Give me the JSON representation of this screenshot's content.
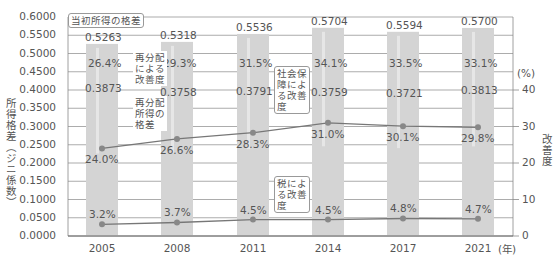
{
  "chart_data": [
    {
      "type": "bar",
      "title": "",
      "xlabel": "(年)",
      "ylabel": "所得格差（ジニ係数）",
      "categories": [
        "2005",
        "2008",
        "2011",
        "2014",
        "2017",
        "2021"
      ],
      "series": [
        {
          "name": "当初所得の格差",
          "values": [
            0.5263,
            0.5318,
            0.5536,
            0.5704,
            0.5594,
            0.57
          ]
        },
        {
          "name": "再分配所得の格差",
          "values": [
            0.3873,
            0.3758,
            0.3791,
            0.3759,
            0.3721,
            0.3813
          ]
        }
      ],
      "ylim": [
        0,
        0.6
      ],
      "ytick_step": 0.05,
      "grid": true
    },
    {
      "type": "line",
      "ylabel": "改善度",
      "yunit": "(%)",
      "categories": [
        "2005",
        "2008",
        "2011",
        "2014",
        "2017",
        "2021"
      ],
      "series": [
        {
          "name": "再分配による改善度",
          "values": [
            26.4,
            29.3,
            31.5,
            34.1,
            33.5,
            33.1
          ],
          "display": "label-in-bar"
        },
        {
          "name": "社会保障による改善度",
          "values": [
            24.0,
            26.6,
            28.3,
            31.0,
            30.1,
            29.8
          ]
        },
        {
          "name": "税による改善度",
          "values": [
            3.2,
            3.7,
            4.5,
            4.5,
            4.8,
            4.7
          ]
        }
      ],
      "ylim": [
        0,
        40
      ],
      "ytick_step": 10
    }
  ],
  "axes": {
    "left_title": "所得格差（ジニ係数）",
    "left_ticks": [
      "0.6000",
      "0.5500",
      "0.5000",
      "0.4500",
      "0.4000",
      "0.3500",
      "0.3000",
      "0.2500",
      "0.2000",
      "0.1500",
      "0.1000",
      "0.0500",
      "0.0000"
    ],
    "right_title": "改善度",
    "right_unit": "(%)",
    "right_ticks": [
      "40",
      "30",
      "20",
      "10",
      "0"
    ],
    "x_ticks": [
      "2005",
      "2008",
      "2011",
      "2014",
      "2017",
      "2021"
    ],
    "x_unit": "(年)"
  },
  "labels": {
    "initial": [
      "0.5263",
      "0.5318",
      "0.5536",
      "0.5704",
      "0.5594",
      "0.5700"
    ],
    "redistributed": [
      "0.3873",
      "0.3758",
      "0.3791",
      "0.3759",
      "0.3721",
      "0.3813"
    ],
    "redistribution_pct": [
      "26.4%",
      "29.3%",
      "31.5%",
      "34.1%",
      "33.5%",
      "33.1%"
    ],
    "social_pct": [
      "24.0%",
      "26.6%",
      "28.3%",
      "31.0%",
      "30.1%",
      "29.8%"
    ],
    "tax_pct": [
      "3.2%",
      "3.7%",
      "4.5%",
      "4.5%",
      "4.8%",
      "4.7%"
    ]
  },
  "callouts": {
    "initial_gap": "当初所得の格差",
    "redistribution_improvement": [
      "再分配",
      "による",
      "改善度"
    ],
    "redistributed_gap": [
      "再分配",
      "所得の",
      "格差"
    ],
    "social_security": [
      "社会保",
      "障によ",
      "る改善",
      "度"
    ],
    "tax": [
      "税によ",
      "る改善",
      "度"
    ]
  },
  "colors": {
    "bar": "#d4d4d4",
    "bar_highlight": "#e6e6e6",
    "grid": "#888888",
    "line": "#777777",
    "marker": "#888888",
    "text": "#555555"
  }
}
